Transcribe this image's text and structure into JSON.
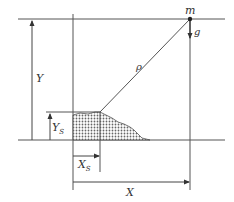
{
  "diagram": {
    "labels": {
      "mass": "m",
      "gravity": "g",
      "distance": "ρ",
      "height": "Y",
      "source_height": "Y",
      "source_height_sub": "S",
      "source_x": "X",
      "source_x_sub": "S",
      "horizontal": "X"
    },
    "colors": {
      "line": "#555555",
      "fill_pattern": "#777777",
      "text": "#333333"
    }
  }
}
